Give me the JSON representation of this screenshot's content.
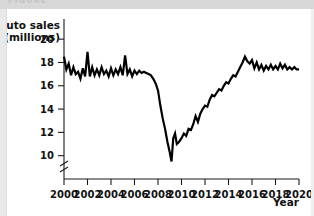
{
  "header": {
    "band_text": "FIGURE"
  },
  "chart_data": {
    "type": "line",
    "title": "",
    "xlabel": "Year",
    "ylabel": "Auto sales (millions)",
    "ylabel_line1": "Auto sales",
    "ylabel_line2": "(millions)",
    "xlim": [
      2000,
      2020
    ],
    "ylim": [
      9,
      20.6
    ],
    "axis_break": true,
    "axis_break_note": "y-axis broken below 10",
    "grid": false,
    "legend": null,
    "yticks": [
      20,
      18,
      16,
      14,
      12,
      10
    ],
    "ytick_labels": [
      "20",
      "18",
      "16",
      "14",
      "12",
      "10"
    ],
    "xticks": [
      2000,
      2002,
      2004,
      2006,
      2008,
      2010,
      2012,
      2014,
      2016,
      2018,
      2020
    ],
    "xtick_labels": [
      "2000",
      "2002",
      "2004",
      "2006",
      "2008",
      "2010",
      "2012",
      "2014",
      "2016",
      "2018",
      "2020"
    ],
    "series": [
      {
        "name": "Auto sales (millions)",
        "color": "#000000",
        "x": [
          2000.0,
          2000.2,
          2000.4,
          2000.6,
          2000.8,
          2001.0,
          2001.2,
          2001.4,
          2001.6,
          2001.8,
          2002.0,
          2002.2,
          2002.4,
          2002.6,
          2002.8,
          2003.0,
          2003.2,
          2003.4,
          2003.6,
          2003.8,
          2004.0,
          2004.2,
          2004.4,
          2004.6,
          2004.8,
          2005.0,
          2005.2,
          2005.4,
          2005.6,
          2005.8,
          2006.0,
          2006.2,
          2006.4,
          2006.6,
          2006.8,
          2007.0,
          2007.2,
          2007.4,
          2007.6,
          2007.8,
          2008.0,
          2008.2,
          2008.4,
          2008.6,
          2008.8,
          2009.0,
          2009.15,
          2009.3,
          2009.45,
          2009.6,
          2009.8,
          2010.0,
          2010.2,
          2010.4,
          2010.6,
          2010.8,
          2011.0,
          2011.2,
          2011.4,
          2011.6,
          2011.8,
          2012.0,
          2012.2,
          2012.4,
          2012.6,
          2012.8,
          2013.0,
          2013.2,
          2013.4,
          2013.6,
          2013.8,
          2014.0,
          2014.2,
          2014.4,
          2014.6,
          2014.8,
          2015.0,
          2015.2,
          2015.4,
          2015.6,
          2015.8,
          2016.0,
          2016.2,
          2016.4,
          2016.6,
          2016.8,
          2017.0,
          2017.2,
          2017.4,
          2017.6,
          2017.8,
          2018.0,
          2018.2,
          2018.4,
          2018.6,
          2018.8,
          2019.0,
          2019.2,
          2019.4,
          2019.6,
          2019.8,
          2020.0
        ],
        "values": [
          18.5,
          17.4,
          17.9,
          16.9,
          17.6,
          17.0,
          17.2,
          16.6,
          17.5,
          16.8,
          18.9,
          16.8,
          17.6,
          16.9,
          17.4,
          16.9,
          17.6,
          17.0,
          17.3,
          16.8,
          17.5,
          16.9,
          17.4,
          17.0,
          17.6,
          16.9,
          18.6,
          17.0,
          17.4,
          16.8,
          17.3,
          17.0,
          17.3,
          17.1,
          17.2,
          17.1,
          17.0,
          16.9,
          16.6,
          16.2,
          15.6,
          14.3,
          13.2,
          12.3,
          11.2,
          10.3,
          9.5,
          11.5,
          11.9,
          11.0,
          11.2,
          11.5,
          11.9,
          11.7,
          12.3,
          12.2,
          12.7,
          13.4,
          12.9,
          13.6,
          14.0,
          14.3,
          14.2,
          14.8,
          15.2,
          15.1,
          15.4,
          15.7,
          15.6,
          16.0,
          16.3,
          16.2,
          16.6,
          16.9,
          16.8,
          17.2,
          17.6,
          18.0,
          18.5,
          18.1,
          17.9,
          18.2,
          17.5,
          18.0,
          17.4,
          17.8,
          17.3,
          17.7,
          17.4,
          17.8,
          17.4,
          17.7,
          17.4,
          17.9,
          17.5,
          17.8,
          17.4,
          17.6,
          17.4,
          17.6,
          17.4,
          17.4
        ]
      }
    ]
  }
}
